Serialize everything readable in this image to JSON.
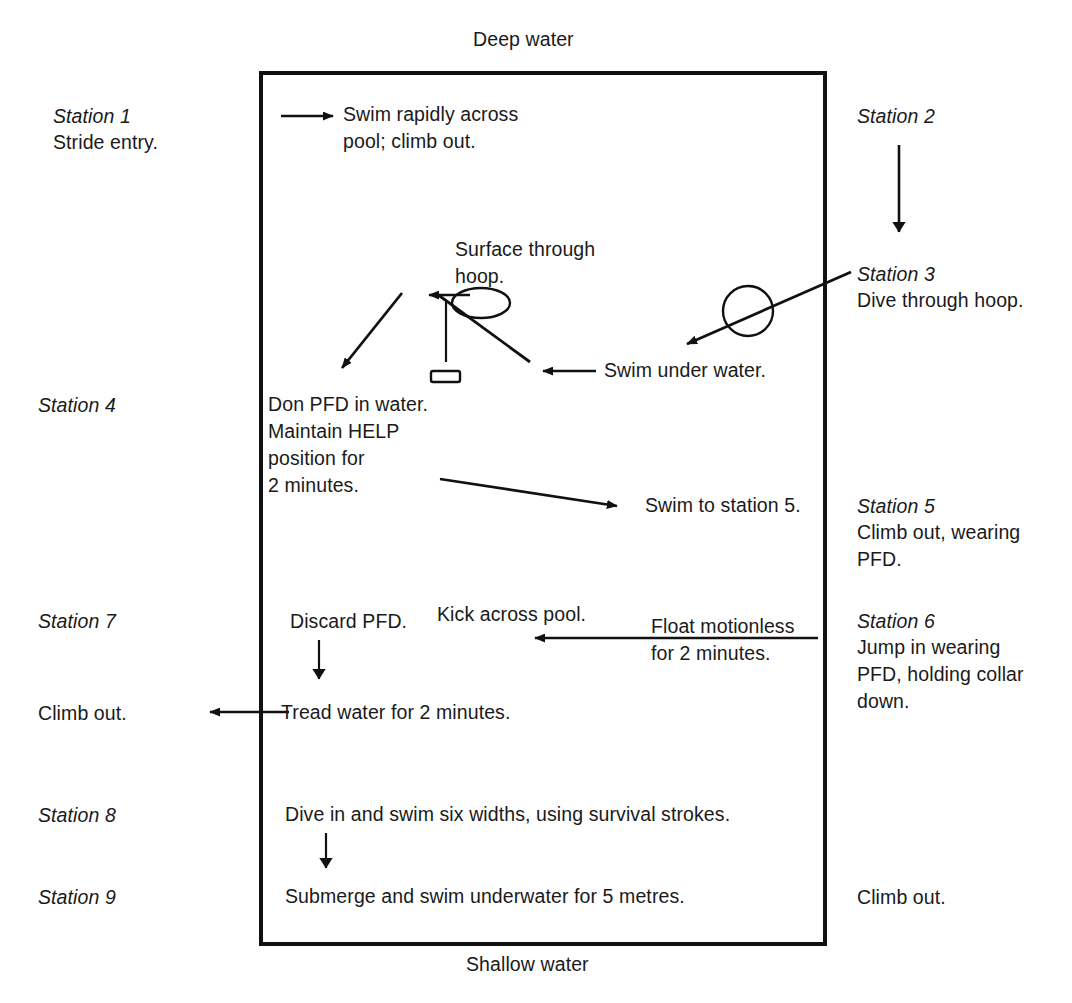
{
  "diagram": {
    "title_top": "Deep water",
    "title_bottom": "Shallow water"
  },
  "pool": {
    "border_color": "#111111",
    "x": 261,
    "y": 73,
    "width": 564,
    "height": 871
  },
  "left_column": [
    {
      "station": "Station 1",
      "text": "Stride entry."
    },
    {
      "station": "Station 4",
      "text": ""
    },
    {
      "station": "Station 7",
      "text": ""
    },
    {
      "station": "",
      "text": "Climb out."
    },
    {
      "station": "Station 8",
      "text": ""
    },
    {
      "station": "Station 9",
      "text": ""
    }
  ],
  "right_column": [
    {
      "station": "Station 2",
      "text": ""
    },
    {
      "station": "Station 3",
      "text": "Dive through hoop."
    },
    {
      "station": "Station 5",
      "text": "Climb out, wearing\nPFD."
    },
    {
      "station": "Station 6",
      "text": "Jump in wearing\nPFD, holding collar\ndown."
    },
    {
      "station": "",
      "text": "Climb out."
    }
  ],
  "pool_text": {
    "swim_rapidly": "Swim rapidly across\npool; climb out.",
    "surface_through_hoop": "Surface through\nhoop.",
    "swim_under_water": "Swim under water.",
    "don_pfd": "Don PFD in water.\nMaintain HELP\nposition for\n2 minutes.",
    "swim_to_station_5": "Swim to station 5.",
    "discard_pfd": "Discard PFD.",
    "kick_across_pool": "Kick across pool.",
    "float_motionless": "Float motionless\nfor 2 minutes.",
    "tread_water": "Tread water for 2 minutes.",
    "dive_in_six_widths": "Dive in and swim six widths, using survival strokes.",
    "submerge_swim": "Submerge and swim underwater for 5 metres."
  },
  "shapes": {
    "hoop_ellipse_label": "hoop-ellipse",
    "hoop_circle_label": "hoop-circle",
    "hoop_post_label": "hoop-post",
    "hoop_base_label": "hoop-base"
  }
}
